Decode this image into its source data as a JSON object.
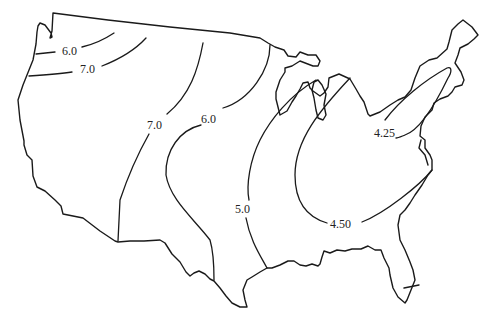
{
  "map": {
    "type": "isoline map",
    "region": "Contiguous United States",
    "contour_labels": [
      {
        "id": "nw-6",
        "text": "6.0",
        "x": 66,
        "y": 54
      },
      {
        "id": "nw-7",
        "text": "7.0",
        "x": 88,
        "y": 71
      },
      {
        "id": "west-7",
        "text": "7.0",
        "x": 155,
        "y": 129
      },
      {
        "id": "central-6",
        "text": "6.0",
        "x": 210,
        "y": 123
      },
      {
        "id": "central-5",
        "text": "5.0",
        "x": 246,
        "y": 210
      },
      {
        "id": "east-450",
        "text": "4.50",
        "x": 342,
        "y": 228
      },
      {
        "id": "ne-425",
        "text": "4.25",
        "x": 378,
        "y": 136
      }
    ],
    "colors": {
      "line": "#1a1a1a",
      "background": "#ffffff",
      "text": "#222222"
    }
  }
}
